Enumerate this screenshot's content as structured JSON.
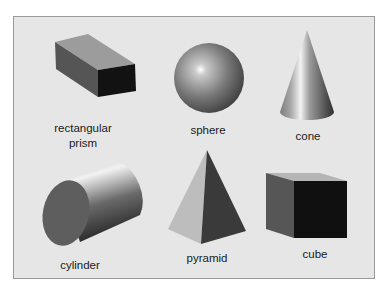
{
  "figure": {
    "background": "#e6e6e6",
    "border_color": "#9a9a9a",
    "shapes": [
      {
        "id": "rectangular-prism",
        "label_line1": "rectangular",
        "label_line2": "prism"
      },
      {
        "id": "sphere",
        "label": "sphere"
      },
      {
        "id": "cone",
        "label": "cone"
      },
      {
        "id": "cylinder",
        "label": "cylinder"
      },
      {
        "id": "pyramid",
        "label": "pyramid"
      },
      {
        "id": "cube",
        "label": "cube"
      }
    ]
  }
}
